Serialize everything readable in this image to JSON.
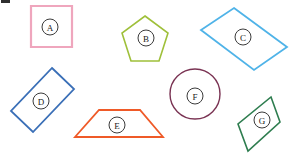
{
  "page": {
    "background_color": "#ffffff",
    "width": 289,
    "height": 153
  },
  "artifact": {
    "name": "top-left-scan-mark",
    "color": "#2f2f2f"
  },
  "shapes": [
    {
      "id": "A",
      "label": "A",
      "kind": "square",
      "color": "#efa6bd",
      "stroke_width": 2.2,
      "points": "31,6 72,6 72,47 31,47",
      "label_pos": {
        "x": 50,
        "y": 27
      }
    },
    {
      "id": "B",
      "label": "B",
      "kind": "pentagon",
      "color": "#9fc03a",
      "stroke_width": 1.6,
      "points": "145,16 168,33 159,61 131,61 122,33",
      "label_pos": {
        "x": 146,
        "y": 38
      }
    },
    {
      "id": "C",
      "label": "C",
      "kind": "parallelogram",
      "color": "#4fb3e8",
      "stroke_width": 1.8,
      "points": "234,8 287,47 254,70 201,30",
      "label_pos": {
        "x": 243,
        "y": 37
      }
    },
    {
      "id": "D",
      "label": "D",
      "kind": "rectangle",
      "color": "#3a6fb7",
      "stroke_width": 1.8,
      "points": "52,68 74,89 33,132 11,111",
      "label_pos": {
        "x": 41,
        "y": 101
      }
    },
    {
      "id": "E",
      "label": "E",
      "kind": "trapezoid",
      "color": "#ef5a28",
      "stroke_width": 1.8,
      "points": "99,110 140,110 163,137 75,137",
      "label_pos": {
        "x": 117,
        "y": 125
      }
    },
    {
      "id": "F",
      "label": "F",
      "kind": "circle",
      "color": "#7a3353",
      "stroke_width": 1.4,
      "center": {
        "x": 195,
        "y": 94
      },
      "radius": 25,
      "label_pos": {
        "x": 195,
        "y": 96
      }
    },
    {
      "id": "G",
      "label": "G",
      "kind": "rhombus",
      "color": "#2e7d4f",
      "stroke_width": 1.6,
      "points": "271,97 280,122 248,151 238,124",
      "label_pos": {
        "x": 262,
        "y": 120
      }
    }
  ],
  "label_style": {
    "circle_radius": 8,
    "circle_stroke": "#3b3b3b",
    "text_color": "#222222"
  }
}
